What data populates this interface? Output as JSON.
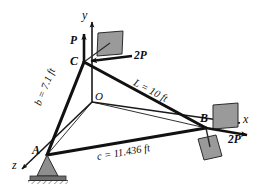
{
  "figure": {
    "type": "statics-free-body-diagram"
  },
  "axes": {
    "y_label": "y",
    "x_label": "x",
    "z_label": "z",
    "origin_label": "O"
  },
  "points": {
    "A": "A",
    "B": "B",
    "C": "C"
  },
  "forces": {
    "p_at_c": "P",
    "two_p_at_c": "2P",
    "two_p_at_b": "2P"
  },
  "dimensions": {
    "b": "b = 7.1 ft",
    "L": "L = 10 ft",
    "c": "c = 11.436 ft"
  },
  "colors": {
    "plate_fill": "#9a9a9a",
    "plate_stroke": "#2b2b2b",
    "member": "#111111",
    "thin_line": "#1a1a1a",
    "support_fill": "#8e8e8e",
    "background": "#ffffff"
  }
}
